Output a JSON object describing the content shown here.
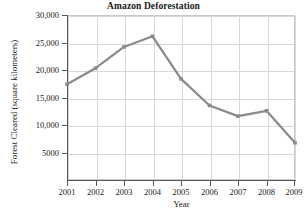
{
  "chart_data": {
    "type": "line",
    "title": "Amazon Deforestation",
    "xlabel": "Year",
    "ylabel": "Forest Cleared (square kilometers)",
    "categories": [
      "2001",
      "2002",
      "2003",
      "2004",
      "2005",
      "2006",
      "2007",
      "2008",
      "2009"
    ],
    "x": [
      2001,
      2002,
      2003,
      2004,
      2005,
      2006,
      2007,
      2008,
      2009
    ],
    "values": [
      18000,
      21000,
      25000,
      27000,
      19000,
      14000,
      12000,
      13000,
      7000
    ],
    "series": [
      {
        "name": "Forest Cleared",
        "values": [
          18000,
          21000,
          25000,
          27000,
          19000,
          14000,
          12000,
          13000,
          7000
        ]
      }
    ],
    "ylim": [
      0,
      31000
    ],
    "xlim": [
      2000.5,
      2009.5
    ],
    "ytick_labels": [
      "30,000",
      "25,000",
      "20,000",
      "15,000",
      "10,000",
      "5000"
    ],
    "ytick_values": [
      30000,
      25000,
      20000,
      15000,
      10000,
      5000
    ],
    "xtick_labels": [
      "2001",
      "2002",
      "2003",
      "2004",
      "2005",
      "2006",
      "2007",
      "2008",
      "2009"
    ],
    "grid": true,
    "legend": false,
    "line_color": "#8a8a8a",
    "marker": "square",
    "marker_color": "#8a8a8a"
  }
}
